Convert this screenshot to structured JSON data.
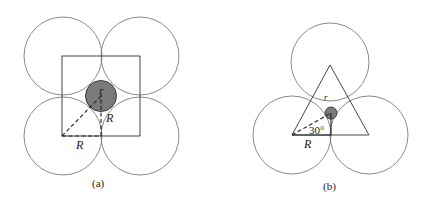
{
  "figure_a": {
    "caption": "(a)",
    "label_small_radius": "r",
    "label_R_diagonal": "R",
    "label_R_base": "R",
    "description": "Four equal circles of radius R arranged in a square with a small shaded circle of radius r in the central gap"
  },
  "figure_b": {
    "caption": "(b)",
    "label_small_radius": "r",
    "label_angle": "30°",
    "label_R_base": "R",
    "description": "Three equal circles of radius R arranged in a triangle with a small shaded circle of radius r in the central gap"
  },
  "colors": {
    "circle_outline": "#6b6b6b",
    "small_circle_fill": "#7a7a7a",
    "line": "#222222"
  }
}
